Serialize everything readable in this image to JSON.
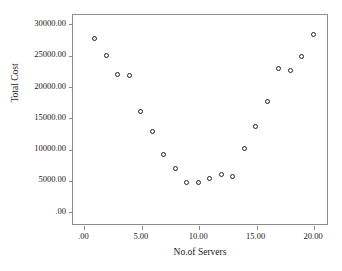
{
  "document": {
    "header_strip_text": ""
  },
  "chart_data": {
    "type": "scatter",
    "title": "",
    "xlabel": "No.of Servers",
    "ylabel": "Total Cost",
    "xlim": [
      -1,
      21.3
    ],
    "ylim": [
      -2200,
      31500
    ],
    "grid": false,
    "legend": null,
    "marker": "open-circle",
    "marker_color": "#222222",
    "xticks": [
      0,
      5,
      10,
      15,
      20
    ],
    "xticklabels": [
      ".00",
      "5.00",
      "10.00",
      "15.00",
      "20.00"
    ],
    "yticks": [
      0,
      5000,
      10000,
      15000,
      20000,
      25000,
      30000
    ],
    "yticklabels": [
      ".00",
      "5000.00",
      "10000.00",
      "15000.00",
      "20000.00",
      "25000.00",
      "30000.00"
    ],
    "x": [
      1,
      2,
      3,
      4,
      5,
      6,
      7,
      8,
      9,
      10,
      11,
      12,
      13,
      14,
      15,
      16,
      17,
      18,
      19,
      20
    ],
    "values": [
      27600,
      24900,
      21900,
      21700,
      15900,
      12700,
      9050,
      6850,
      4550,
      4650,
      5250,
      5800,
      5500,
      10000,
      13600,
      17600,
      22800,
      22500,
      24700,
      28200
    ],
    "points": [
      {
        "x": 1,
        "y": 27600
      },
      {
        "x": 2,
        "y": 24900
      },
      {
        "x": 3,
        "y": 21900
      },
      {
        "x": 4,
        "y": 21700
      },
      {
        "x": 5,
        "y": 15900
      },
      {
        "x": 6,
        "y": 12700
      },
      {
        "x": 7,
        "y": 9050
      },
      {
        "x": 8,
        "y": 6850
      },
      {
        "x": 9,
        "y": 4550
      },
      {
        "x": 10,
        "y": 4650
      },
      {
        "x": 11,
        "y": 5250
      },
      {
        "x": 12,
        "y": 5800
      },
      {
        "x": 13,
        "y": 5500
      },
      {
        "x": 14,
        "y": 10000
      },
      {
        "x": 15,
        "y": 13600
      },
      {
        "x": 16,
        "y": 17600
      },
      {
        "x": 17,
        "y": 22800
      },
      {
        "x": 18,
        "y": 22500
      },
      {
        "x": 19,
        "y": 24700
      },
      {
        "x": 20,
        "y": 28200
      }
    ]
  }
}
